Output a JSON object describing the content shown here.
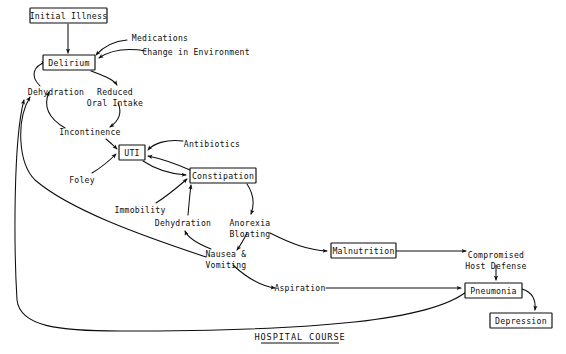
{
  "diagram": {
    "caption": "HOSPITAL COURSE",
    "colors": {
      "ink": "#0d0d0d",
      "background": "#ffffff"
    },
    "boxed_nodes": [
      {
        "id": "initial-illness",
        "label": "Initial Illness",
        "x": 30,
        "y": 8,
        "w": 77,
        "h": 15
      },
      {
        "id": "delirium",
        "label": "Delirium",
        "x": 43,
        "y": 55,
        "w": 52,
        "h": 15
      },
      {
        "id": "uti",
        "label": "UTI",
        "x": 119,
        "y": 145,
        "w": 26,
        "h": 15
      },
      {
        "id": "constipation",
        "label": "Constipation",
        "x": 190,
        "y": 168,
        "w": 66,
        "h": 15
      },
      {
        "id": "malnutrition",
        "label": "Malnutrition",
        "x": 331,
        "y": 243,
        "w": 65,
        "h": 15
      },
      {
        "id": "pneumonia",
        "label": "Pneumonia",
        "x": 465,
        "y": 283,
        "w": 57,
        "h": 15
      },
      {
        "id": "depression",
        "label": "Depression",
        "x": 490,
        "y": 313,
        "w": 62,
        "h": 15
      }
    ],
    "plain_nodes": [
      {
        "id": "medications",
        "lines": [
          "Medications"
        ],
        "x": 160,
        "y": 38
      },
      {
        "id": "change-in-environment",
        "lines": [
          "Change in Environment"
        ],
        "x": 196,
        "y": 52
      },
      {
        "id": "dehydration-upper",
        "lines": [
          "Dehydration"
        ],
        "x": 56,
        "y": 92
      },
      {
        "id": "reduced-oral-intake",
        "lines": [
          "Reduced",
          "Oral Intake"
        ],
        "x": 115,
        "y": 92
      },
      {
        "id": "incontinence",
        "lines": [
          "Incontinence"
        ],
        "x": 90,
        "y": 132
      },
      {
        "id": "antibiotics",
        "lines": [
          "Antibiotics"
        ],
        "x": 212,
        "y": 144
      },
      {
        "id": "foley",
        "lines": [
          "Foley"
        ],
        "x": 82,
        "y": 180
      },
      {
        "id": "immobility",
        "lines": [
          "Immobility"
        ],
        "x": 140,
        "y": 210
      },
      {
        "id": "dehydration-lower",
        "lines": [
          "Dehydration"
        ],
        "x": 183,
        "y": 223
      },
      {
        "id": "anorexia-bloating",
        "lines": [
          "Anorexia",
          "Bloating"
        ],
        "x": 250,
        "y": 223
      },
      {
        "id": "nausea-vomiting",
        "lines": [
          "Nausea &",
          "Vomiting"
        ],
        "x": 226,
        "y": 254
      },
      {
        "id": "aspiration",
        "lines": [
          "Aspiration"
        ],
        "x": 300,
        "y": 288
      },
      {
        "id": "compromised-host-defense",
        "lines": [
          "Compromised",
          "Host Defense"
        ],
        "x": 496,
        "y": 255
      }
    ],
    "edges": [
      {
        "id": "initial-illness-to-delirium",
        "from": "Initial Illness",
        "to": "Delirium"
      },
      {
        "id": "medications-to-delirium",
        "from": "Medications",
        "to": "Delirium"
      },
      {
        "id": "change-in-environment-to-delirium",
        "from": "Change in Environment",
        "to": "Delirium"
      },
      {
        "id": "delirium-to-reduced-oral-intake",
        "from": "Delirium",
        "to": "Reduced Oral Intake"
      },
      {
        "id": "reduced-oral-intake-to-incontinence",
        "from": "Reduced Oral Intake",
        "to": "Incontinence"
      },
      {
        "id": "dehydration-upper-to-delirium",
        "from": "Dehydration",
        "to": "Delirium"
      },
      {
        "id": "incontinence-to-dehydration-upper",
        "from": "Incontinence",
        "to": "Dehydration"
      },
      {
        "id": "incontinence-to-uti",
        "from": "Incontinence",
        "to": "UTI"
      },
      {
        "id": "antibiotics-to-uti",
        "from": "Antibiotics",
        "to": "UTI"
      },
      {
        "id": "foley-to-uti",
        "from": "Foley",
        "to": "UTI"
      },
      {
        "id": "uti-to-constipation",
        "from": "UTI",
        "to": "Constipation"
      },
      {
        "id": "constipation-to-uti",
        "from": "Constipation",
        "to": "UTI"
      },
      {
        "id": "immobility-to-constipation",
        "from": "Immobility",
        "to": "Constipation"
      },
      {
        "id": "dehydration-lower-to-constipation",
        "from": "Dehydration",
        "to": "Constipation"
      },
      {
        "id": "constipation-to-anorexia-bloating",
        "from": "Constipation",
        "to": "Anorexia Bloating"
      },
      {
        "id": "anorexia-bloating-to-nausea-vomiting",
        "from": "Anorexia Bloating",
        "to": "Nausea & Vomiting"
      },
      {
        "id": "nausea-vomiting-to-dehydration-lower",
        "from": "Nausea & Vomiting",
        "to": "Dehydration"
      },
      {
        "id": "anorexia-bloating-to-malnutrition",
        "from": "Anorexia Bloating",
        "to": "Malnutrition"
      },
      {
        "id": "nausea-vomiting-to-aspiration",
        "from": "Nausea & Vomiting",
        "to": "Aspiration"
      },
      {
        "id": "aspiration-to-pneumonia",
        "from": "Aspiration",
        "to": "Pneumonia"
      },
      {
        "id": "malnutrition-to-compromised-host-defense",
        "from": "Malnutrition",
        "to": "Compromised Host Defense"
      },
      {
        "id": "compromised-host-defense-to-pneumonia",
        "from": "Compromised Host Defense",
        "to": "Pneumonia"
      },
      {
        "id": "pneumonia-to-depression",
        "from": "Pneumonia",
        "to": "Depression"
      },
      {
        "id": "nausea-vomiting-to-dehydration-upper",
        "from": "Nausea & Vomiting",
        "to": "Dehydration"
      },
      {
        "id": "pneumonia-to-dehydration-upper",
        "from": "Pneumonia",
        "to": "Dehydration"
      }
    ]
  }
}
